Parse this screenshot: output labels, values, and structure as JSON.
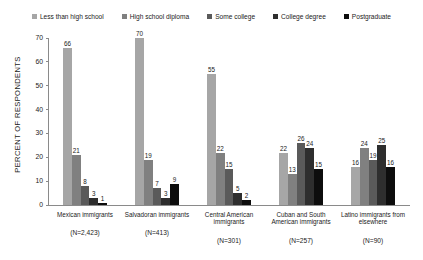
{
  "chart_data": {
    "type": "bar",
    "title": "",
    "subtitle": "",
    "xlabel": "",
    "ylabel": "PERCENT OF RESPONDENTS",
    "ylim": [
      0,
      70
    ],
    "yticks": [
      0,
      10,
      20,
      30,
      40,
      50,
      60,
      70
    ],
    "grid": false,
    "legend_position": "top",
    "categories": [
      "Mexican immigrants",
      "Salvadoran immigrants",
      "Central American immigrants",
      "Cuban and South American immigrants",
      "Latino immigrants from elsewhere"
    ],
    "category_counts": [
      "(N=2,423)",
      "(N=413)",
      "(N=301)",
      "(N=257)",
      "(N=90)"
    ],
    "series": [
      {
        "name": "Less than high school",
        "color": "#a6a6a6",
        "values": [
          66,
          70,
          55,
          22,
          16
        ]
      },
      {
        "name": "High school diploma",
        "color": "#808080",
        "values": [
          21,
          19,
          22,
          13,
          24
        ]
      },
      {
        "name": "Some college",
        "color": "#5a5a5a",
        "values": [
          8,
          7,
          15,
          26,
          19
        ]
      },
      {
        "name": "College degree",
        "color": "#2e2e2e",
        "values": [
          3,
          3,
          5,
          24,
          25
        ]
      },
      {
        "name": "Postgraduate",
        "color": "#0d0d0d",
        "values": [
          1,
          9,
          2,
          15,
          16
        ]
      }
    ]
  }
}
